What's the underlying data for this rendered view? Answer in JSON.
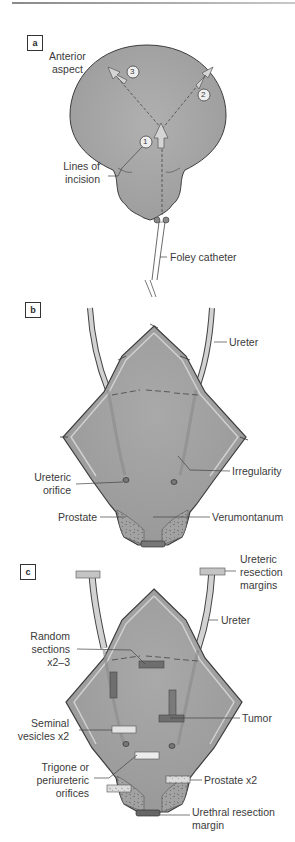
{
  "panels": {
    "a": {
      "tag": "a",
      "labels": {
        "anterior_aspect_1": "Anterior",
        "anterior_aspect_2": "aspect",
        "lines_of_incision_1": "Lines of",
        "lines_of_incision_2": "incision",
        "foley_catheter": "Foley catheter"
      },
      "markers": [
        "1",
        "2",
        "3"
      ]
    },
    "b": {
      "tag": "b",
      "labels": {
        "ureter": "Ureter",
        "irregularity": "Irregularity",
        "ureteric_orifice_1": "Ureteric",
        "ureteric_orifice_2": "orifice",
        "prostate": "Prostate",
        "verumontanum": "Verumontanum"
      }
    },
    "c": {
      "tag": "c",
      "labels": {
        "ureteric_resection_margins_1": "Ureteric",
        "ureteric_resection_margins_2": "resection",
        "ureteric_resection_margins_3": "margins",
        "ureter": "Ureter",
        "random_sections_1": "Random",
        "random_sections_2": "sections",
        "random_sections_3": "x2–3",
        "tumor": "Tumor",
        "seminal_vesicles_1": "Seminal",
        "seminal_vesicles_2": "vesicles x2",
        "trigone_1": "Trigone or",
        "trigone_2": "periureteric",
        "trigone_3": "orifices",
        "prostate_x2": "Prostate x2",
        "urethral_margin_1": "Urethral resection",
        "urethral_margin_2": "margin"
      }
    }
  },
  "colors": {
    "tissue": "#a6a6a6",
    "tissue_dark": "#8c8c8c",
    "outline": "#3c3c3c",
    "ureter_fill": "#d2d2d2",
    "section_dark": "#6e6e6e",
    "section_light": "#e4e4e4",
    "prostate_fill": "#9a9a9a"
  }
}
